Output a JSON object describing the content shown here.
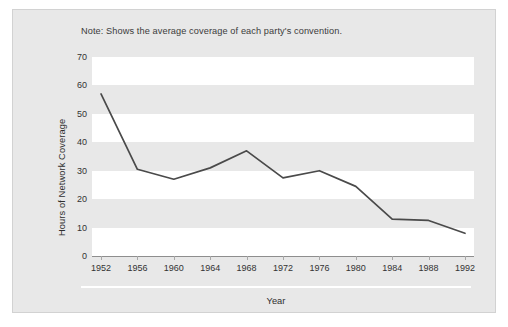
{
  "note": "Note: Shows the average coverage of each party's convention.",
  "axis": {
    "y_ticks": [
      "70",
      "60",
      "50",
      "40",
      "30",
      "20",
      "10",
      "0"
    ],
    "x_ticks": [
      "1952",
      "1956",
      "1960",
      "1964",
      "1968",
      "1972",
      "1976",
      "1980",
      "1984",
      "1988",
      "1992"
    ],
    "y_title": "Hours of Network Coverage",
    "x_title": "Year"
  },
  "colors": {
    "panel_background": "#e8e8e8",
    "plot_band": "#ffffff",
    "line": "#4a4a4a",
    "axis": "#8e8e8e",
    "text": "#333333"
  },
  "chart_data": {
    "type": "line",
    "title": "",
    "subtitle": "Note: Shows the average coverage of each party's convention.",
    "xlabel": "Year",
    "ylabel": "Hours of Network Coverage",
    "x": [
      1952,
      1956,
      1960,
      1964,
      1968,
      1972,
      1976,
      1980,
      1984,
      1988,
      1992
    ],
    "xtick_labels": [
      "1952",
      "1956",
      "1960",
      "1964",
      "1968",
      "1972",
      "1976",
      "1980",
      "1984",
      "1988",
      "1992"
    ],
    "values": [
      57,
      30.5,
      27,
      31,
      37,
      27.5,
      30,
      24.5,
      13,
      12.5,
      8
    ],
    "ytick_labels": [
      "0",
      "10",
      "20",
      "30",
      "40",
      "50",
      "60",
      "70"
    ],
    "ylim": [
      0,
      70
    ],
    "xlim": [
      1952,
      1992
    ],
    "ytick_step": 10,
    "grid": "horizontal-alternating-bands",
    "legend": "none",
    "line_color": "#4a4a4a",
    "markers": false
  }
}
